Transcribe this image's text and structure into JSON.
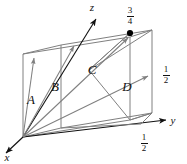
{
  "figure": {
    "type": "crystal-unit-cell-vector-diagram",
    "colors": {
      "line": "#808080",
      "axis": "#111111",
      "text": "#111111",
      "background": "#ffffff",
      "dot": "#000000"
    },
    "axes": [
      {
        "name": "x-axis",
        "label": "x"
      },
      {
        "name": "y-axis",
        "label": "y"
      },
      {
        "name": "z-axis",
        "label": "z"
      }
    ],
    "vectors": [
      {
        "name": "vector-a",
        "label": "A"
      },
      {
        "name": "vector-b",
        "label": "B"
      },
      {
        "name": "vector-c",
        "label": "C"
      },
      {
        "name": "vector-d",
        "label": "D"
      }
    ],
    "fractions": [
      {
        "name": "fraction-top",
        "numerator": "3",
        "denominator": "4"
      },
      {
        "name": "fraction-right",
        "numerator": "1",
        "denominator": "2"
      },
      {
        "name": "fraction-bottom",
        "numerator": "1",
        "denominator": "2"
      }
    ],
    "markers": [
      {
        "name": "point-marker-three-quarters"
      }
    ]
  }
}
